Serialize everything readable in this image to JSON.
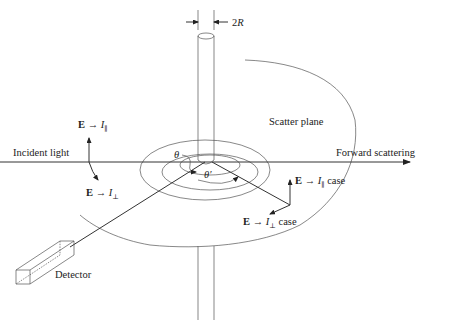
{
  "diagram": {
    "type": "light-scattering-geometry",
    "labels": {
      "diameter": "2R",
      "incident_light": "Incident light",
      "forward_scattering": "Forward scattering",
      "scatter_plane": "Scatter plane",
      "detector": "Detector",
      "theta": "θ",
      "theta_prime": "θ′"
    },
    "polarization": {
      "incident_parallel": {
        "E": "E",
        "arrow": "→",
        "I": "I",
        "sub": "∥"
      },
      "incident_perp": {
        "E": "E",
        "arrow": "→",
        "I": "I",
        "sub": "⊥"
      },
      "scattered_parallel": {
        "E": "E",
        "arrow": "→",
        "I": "I",
        "sub": "∥",
        "suffix": "case"
      },
      "scattered_perp": {
        "E": "E",
        "arrow": "→",
        "I": "I",
        "sub": "⊥",
        "suffix": "case"
      }
    },
    "colors": {
      "line": "#333333",
      "thin": "#555555",
      "background": "#ffffff"
    }
  }
}
